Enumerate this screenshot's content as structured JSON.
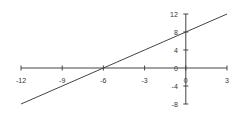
{
  "chart_data": {
    "type": "line",
    "title": "",
    "xlabel": "",
    "ylabel": "",
    "xlim": [
      -12,
      3
    ],
    "ylim": [
      -8,
      12
    ],
    "grid": false,
    "legend": null,
    "x_ticks": [
      -12,
      -9,
      -6,
      -3,
      0,
      3
    ],
    "y_ticks": [
      12,
      8,
      4,
      0,
      -4,
      -8
    ],
    "x_tick_labels": [
      "-12",
      "-9",
      "-6",
      "-3",
      "0",
      "3"
    ],
    "y_tick_labels": [
      "12",
      "8",
      "4",
      "0",
      "-4",
      "-8"
    ],
    "series": [
      {
        "name": "line",
        "x": [
          -12,
          -9,
          -6,
          -3,
          0,
          3
        ],
        "values": [
          -8,
          -4,
          0,
          4,
          8,
          12
        ]
      }
    ],
    "colors": {
      "axis": "#444444",
      "line": "#444444"
    }
  }
}
